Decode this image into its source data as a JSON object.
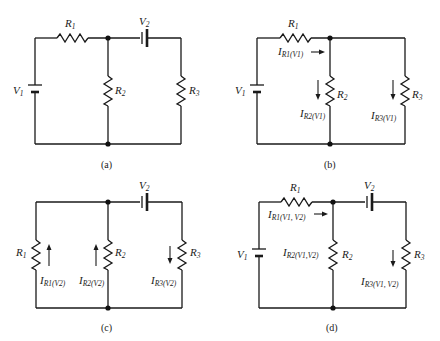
{
  "figure": "Superposition theorem circuit analysis",
  "panels": [
    {
      "id": "a",
      "caption": "(a)",
      "labels": {
        "R1": "R",
        "R1_sub": "1",
        "R2": "R",
        "R2_sub": "2",
        "R3": "R",
        "R3_sub": "3",
        "V1": "V",
        "V1_sub": "1",
        "V2": "V",
        "V2_sub": "2"
      }
    },
    {
      "id": "b",
      "caption": "(b)",
      "labels": {
        "R1": "R",
        "R1_sub": "1",
        "R2": "R",
        "R2_sub": "2",
        "R3": "R",
        "R3_sub": "3",
        "V1": "V",
        "V1_sub": "1"
      },
      "currents": [
        {
          "name": "I",
          "sub": "R1(V1)",
          "direction": "right"
        },
        {
          "name": "I",
          "sub": "R2(V1)",
          "direction": "down"
        },
        {
          "name": "I",
          "sub": "R3(V1)",
          "direction": "down"
        }
      ]
    },
    {
      "id": "c",
      "caption": "(c)",
      "labels": {
        "R1": "R",
        "R1_sub": "1",
        "R2": "R",
        "R2_sub": "2",
        "R3": "R",
        "R3_sub": "3",
        "V2": "V",
        "V2_sub": "2"
      },
      "currents": [
        {
          "name": "I",
          "sub": "R1(V2)",
          "direction": "up"
        },
        {
          "name": "I",
          "sub": "R2(V2)",
          "direction": "up"
        },
        {
          "name": "I",
          "sub": "R3(V2)",
          "direction": "down"
        }
      ]
    },
    {
      "id": "d",
      "caption": "(d)",
      "labels": {
        "R1": "R",
        "R1_sub": "1",
        "R2": "R",
        "R2_sub": "2",
        "R3": "R",
        "R3_sub": "3",
        "V1": "V",
        "V1_sub": "1",
        "V2": "V",
        "V2_sub": "2"
      },
      "currents": [
        {
          "name": "I",
          "sub": "R1(V1, V2)",
          "direction": "right"
        },
        {
          "name": "I",
          "sub": "R2(V1,V2)",
          "direction": "none"
        },
        {
          "name": "I",
          "sub": "R3(V1, V2)",
          "direction": "down"
        }
      ]
    }
  ]
}
